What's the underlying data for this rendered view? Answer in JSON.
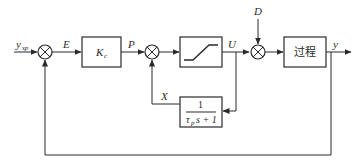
{
  "diagram": {
    "type": "control-block-diagram",
    "signals": {
      "setpoint": "y",
      "setpoint_sub": "sp",
      "error": "E",
      "controller_output": "P",
      "limiter_output": "U",
      "disturbance": "D",
      "process_output": "y",
      "feedback_filter_output": "X"
    },
    "blocks": {
      "controller": {
        "label": "K",
        "label_sub": "c"
      },
      "limiter": {
        "label": "saturation"
      },
      "process": {
        "label": "过程"
      },
      "filter": {
        "numerator": "1",
        "denominator_tau": "τ",
        "denominator_sub": "p",
        "denominator_rest": "s + 1"
      }
    },
    "summing_junctions": [
      "sum-error",
      "sum-positive-feedback",
      "sum-disturbance"
    ]
  }
}
